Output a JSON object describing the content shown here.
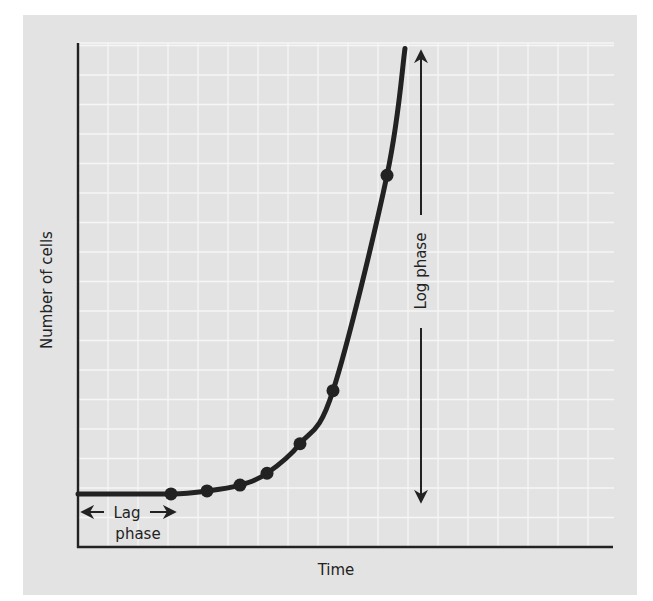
{
  "chart_data": {
    "type": "line",
    "title": "",
    "xlabel": "Time",
    "ylabel": "Number of cells",
    "grid": true,
    "legend": null,
    "xlim": [
      0,
      17.8
    ],
    "ylim": [
      0,
      17
    ],
    "x_ticks": [],
    "y_ticks": [],
    "series": [
      {
        "name": "Bacterial growth curve",
        "points": [
          {
            "x": 3.1,
            "y": 1.8
          },
          {
            "x": 4.3,
            "y": 1.9
          },
          {
            "x": 5.4,
            "y": 2.1
          },
          {
            "x": 6.3,
            "y": 2.5
          },
          {
            "x": 7.4,
            "y": 3.5
          },
          {
            "x": 8.5,
            "y": 5.3
          },
          {
            "x": 10.3,
            "y": 12.6
          }
        ],
        "curve_start": {
          "x": 0,
          "y": 1.8
        },
        "curve_end": {
          "x": 10.9,
          "y": 16.9
        }
      }
    ],
    "annotations": [
      {
        "text_line1": "Lag",
        "text_line2": "phase",
        "type": "double-arrow-horizontal",
        "x_range": [
          0,
          3.3
        ]
      },
      {
        "text": "Log phase",
        "type": "double-arrow-vertical",
        "y_range": [
          1.5,
          16.9
        ]
      }
    ]
  },
  "labels": {
    "x_axis": "Time",
    "y_axis": "Number of cells",
    "lag_line1": "Lag",
    "lag_line2": "phase",
    "log_phase": "Log phase"
  },
  "colors": {
    "panel": "#e3e3e3",
    "grid": "#f6f6f6",
    "ink": "#222222"
  }
}
